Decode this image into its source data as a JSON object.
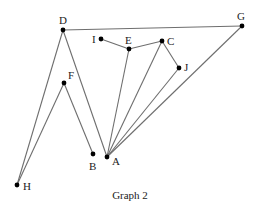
{
  "caption": "Graph 2",
  "colors": {
    "edge": "#6e6e6e",
    "vertex": "#000000",
    "label": "#222222",
    "background": "#ffffff"
  },
  "vertices": [
    {
      "id": "A",
      "x": 107,
      "y": 157,
      "lx": 112,
      "ly": 165
    },
    {
      "id": "B",
      "x": 93,
      "y": 154,
      "lx": 89,
      "ly": 170
    },
    {
      "id": "C",
      "x": 162,
      "y": 41,
      "lx": 167,
      "ly": 45
    },
    {
      "id": "D",
      "x": 63,
      "y": 30,
      "lx": 59,
      "ly": 24
    },
    {
      "id": "E",
      "x": 129,
      "y": 49,
      "lx": 125,
      "ly": 44
    },
    {
      "id": "F",
      "x": 64,
      "y": 83,
      "lx": 68,
      "ly": 79
    },
    {
      "id": "G",
      "x": 242,
      "y": 26,
      "lx": 237,
      "ly": 20
    },
    {
      "id": "H",
      "x": 17,
      "y": 185,
      "lx": 23,
      "ly": 190
    },
    {
      "id": "I",
      "x": 101,
      "y": 39,
      "lx": 92,
      "ly": 43
    },
    {
      "id": "J",
      "x": 179,
      "y": 68,
      "lx": 184,
      "ly": 71
    }
  ],
  "edges": [
    [
      "D",
      "G"
    ],
    [
      "D",
      "H"
    ],
    [
      "D",
      "A"
    ],
    [
      "F",
      "H"
    ],
    [
      "F",
      "B"
    ],
    [
      "I",
      "E"
    ],
    [
      "E",
      "C"
    ],
    [
      "E",
      "A"
    ],
    [
      "C",
      "A"
    ],
    [
      "C",
      "J"
    ],
    [
      "J",
      "A"
    ],
    [
      "G",
      "A"
    ]
  ]
}
